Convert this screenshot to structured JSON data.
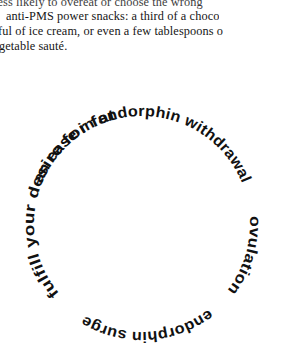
{
  "page": {
    "background_color": "#ffffff",
    "text_color": "#161616"
  },
  "prose": {
    "lines": [
      "less likely to overeat or choose the wrong",
      "anti-PMS power snacks: a third of a choco",
      "ful of ice cream, or even a few tablespoons o",
      "getable sauté."
    ]
  },
  "wheel": {
    "center_x": 142,
    "center_y": 224,
    "radius": 108,
    "accent_color": "#111111",
    "segments": [
      {
        "label": "an ease in endorphin withdrawal",
        "start_angle": -68,
        "end_angle": 68
      },
      {
        "label": "ovulation",
        "start_angle": 86,
        "end_angle": 128
      },
      {
        "label": "endorphin surge",
        "start_angle": 142,
        "end_angle": 212
      },
      {
        "label": "fulfill your desire for fat",
        "start_angle": 230,
        "end_angle": 346
      }
    ]
  }
}
